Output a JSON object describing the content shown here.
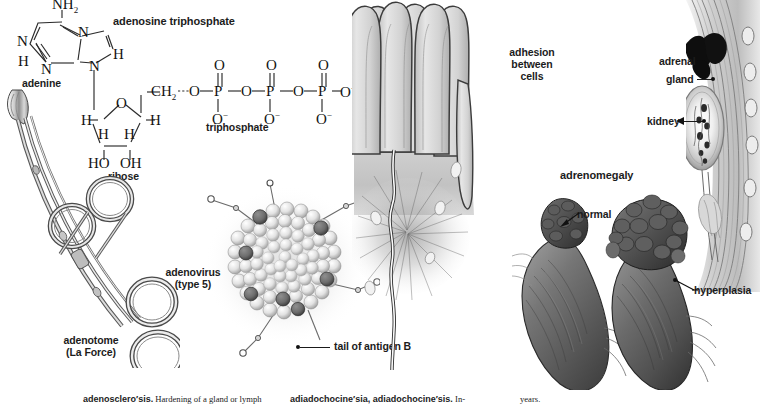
{
  "page": {
    "background_color": "#ffffff",
    "width": 760,
    "height": 412
  },
  "figures": {
    "atp": {
      "title": "adenosine triphosphate",
      "parts": {
        "adenine": "adenine",
        "ribose": "ribose",
        "triphosphate": "triphosphate"
      },
      "atoms": {
        "amine": "NH",
        "amine_sub": "2",
        "n1": "N",
        "n2": "N",
        "n3": "N",
        "n4": "N",
        "h_left": "H",
        "h_right": "H",
        "ch2": "CH",
        "ch2_sub": "2",
        "o_link1": "O",
        "o_link2": "O",
        "o_link3": "O",
        "o_term": "O",
        "p1": "P",
        "p2": "P",
        "p3": "P",
        "o_double": "O",
        "o_minus": "O",
        "minus": "−",
        "ring_o": "O",
        "h_a": "H",
        "h_b": "H",
        "h_c": "H",
        "h_d": "H",
        "ho": "HO",
        "oh": "OH"
      }
    },
    "adenotome": {
      "label_line1": "adenotome",
      "label_line2": "(La Force)"
    },
    "adenovirus": {
      "label_line1": "adenovirus",
      "label_line2": "(type 5)",
      "callout": "tail of antigen B"
    },
    "adhesion": {
      "label_line1": "adhesion",
      "label_line2": "between",
      "label_line3": "cells"
    },
    "adrenal": {
      "label_line1": "adrenal",
      "label_line2": "gland",
      "kidney_label": "kidney"
    },
    "adrenomegaly": {
      "title": "adrenomegaly",
      "normal_label": "normal",
      "hyperplasia_label": "hyperplasia"
    }
  },
  "footer": {
    "col1_headword": "adenosclero′sis.",
    "col1_text": " Hardening of a gland or lymph",
    "col2_headword": "adiadochocine′sia, adiadochocine′sis.",
    "col2_text": " In-",
    "col3_text": "years."
  }
}
